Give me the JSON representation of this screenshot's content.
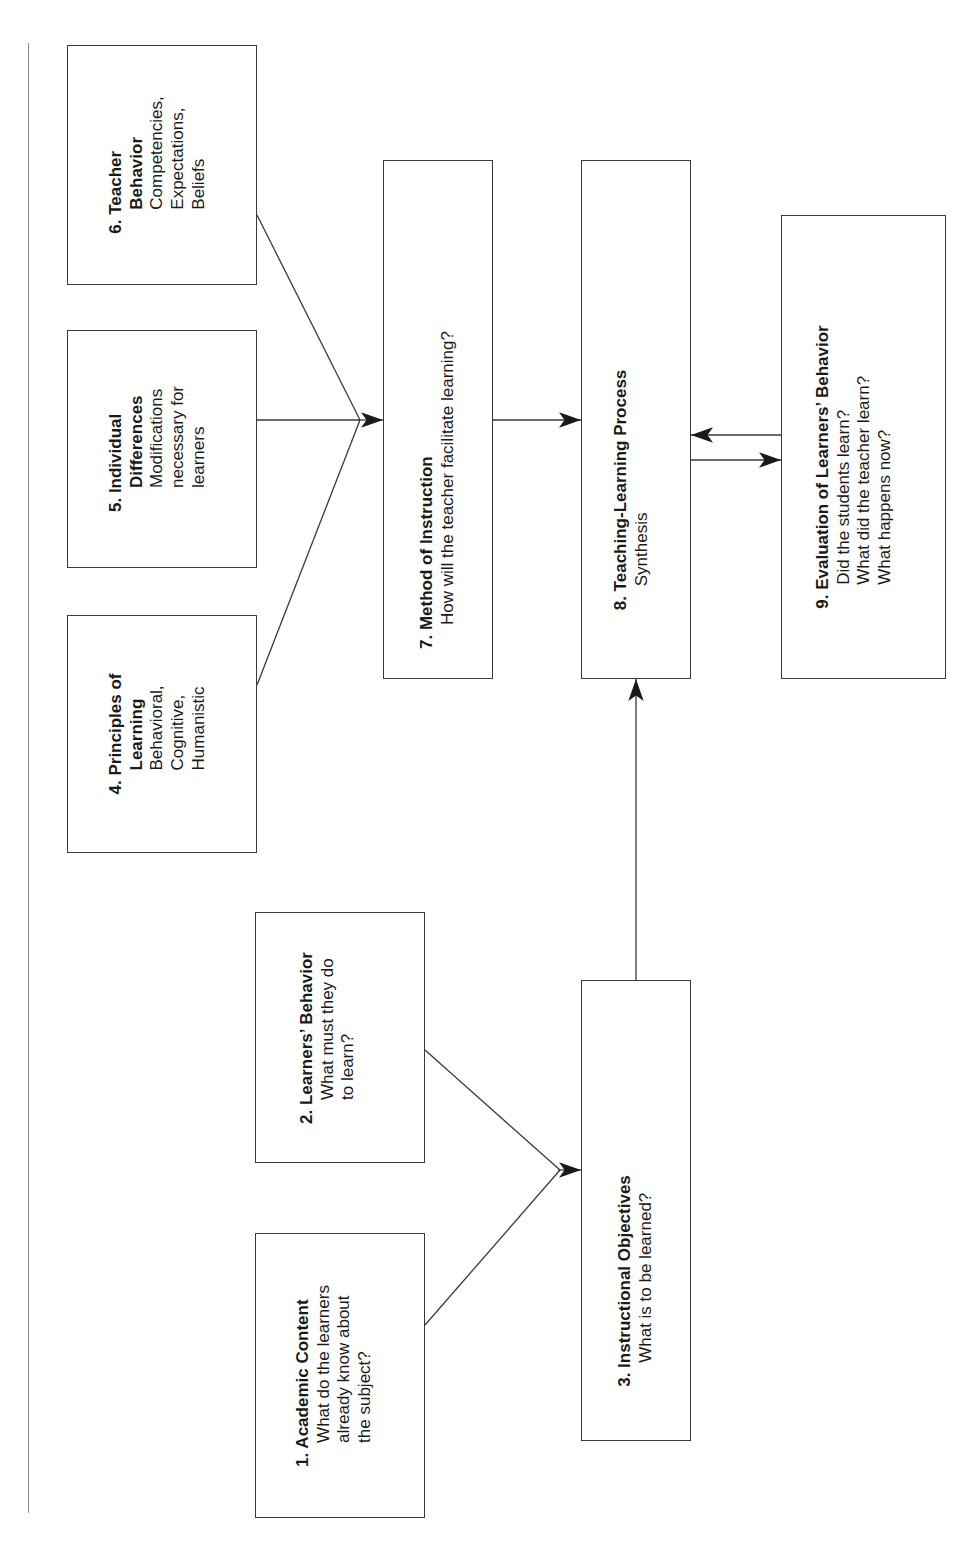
{
  "diagram": {
    "type": "flowchart",
    "orientation": "rotated-90-ccw",
    "colors": {
      "line": "#3a3a3a",
      "box_border": "#3a3a3a",
      "background": "#ffffff",
      "text": "#1a1a1a"
    },
    "nodes": [
      {
        "id": "1",
        "title": "1. Academic Content",
        "lines": [
          "What do the learners",
          "already know about",
          "the subject?"
        ]
      },
      {
        "id": "2",
        "title": "2. Learners’ Behavior",
        "lines": [
          "What must they do",
          "to learn?"
        ]
      },
      {
        "id": "3",
        "title": "3. Instructional Objectives",
        "lines": [
          "What is to be learned?"
        ]
      },
      {
        "id": "4",
        "title_lines": [
          "4. Principles of",
          "Learning"
        ],
        "lines": [
          "Behavioral,",
          "Cognitive,",
          "Humanistic"
        ]
      },
      {
        "id": "5",
        "title_lines": [
          "5. Individual",
          "Differences"
        ],
        "lines": [
          "Modifications",
          "necessary for",
          "learners"
        ]
      },
      {
        "id": "6",
        "title_lines": [
          "6. Teacher",
          "Behavior"
        ],
        "lines": [
          "Competencies,",
          "Expectations,",
          "Beliefs"
        ]
      },
      {
        "id": "7",
        "title": "7. Method of Instruction",
        "lines": [
          "How will the teacher facilitate learning?"
        ]
      },
      {
        "id": "8",
        "title": "8. Teaching-Learning Process",
        "lines": [
          "Synthesis"
        ]
      },
      {
        "id": "9",
        "title": "9. Evaluation of Learners’ Behavior",
        "lines": [
          "Did the students learn?",
          "What did the teacher learn?",
          "What happens now?"
        ]
      }
    ],
    "edges": [
      {
        "from": "1",
        "to": "3"
      },
      {
        "from": "2",
        "to": "3"
      },
      {
        "from": "3",
        "to": "8"
      },
      {
        "from": "4",
        "to": "7"
      },
      {
        "from": "5",
        "to": "7"
      },
      {
        "from": "6",
        "to": "7"
      },
      {
        "from": "7",
        "to": "8"
      },
      {
        "from": "8",
        "to": "9"
      },
      {
        "from": "9",
        "to": "8"
      }
    ]
  }
}
